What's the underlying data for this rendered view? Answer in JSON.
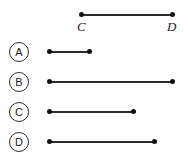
{
  "figure": {
    "background_color": "#fefefe",
    "line_color": "#2b2b2b",
    "dot_color": "#111111",
    "reference": {
      "name": "segment-CD",
      "start_label": "C",
      "end_label": "D",
      "x_start": 79,
      "x_end": 172,
      "y": 15,
      "length_px": 93
    },
    "options": [
      {
        "label": "A",
        "x_start": 47,
        "x_end": 89,
        "y": 52,
        "length_px": 42,
        "circle_x": 9,
        "circle_y": 42
      },
      {
        "label": "B",
        "x_start": 47,
        "x_end": 172,
        "y": 82,
        "length_px": 125,
        "circle_x": 9,
        "circle_y": 72
      },
      {
        "label": "C",
        "x_start": 47,
        "x_end": 133,
        "y": 112,
        "length_px": 86,
        "circle_x": 9,
        "circle_y": 102
      },
      {
        "label": "D",
        "x_start": 47,
        "x_end": 154,
        "y": 142,
        "length_px": 107,
        "circle_x": 9,
        "circle_y": 132
      }
    ]
  }
}
